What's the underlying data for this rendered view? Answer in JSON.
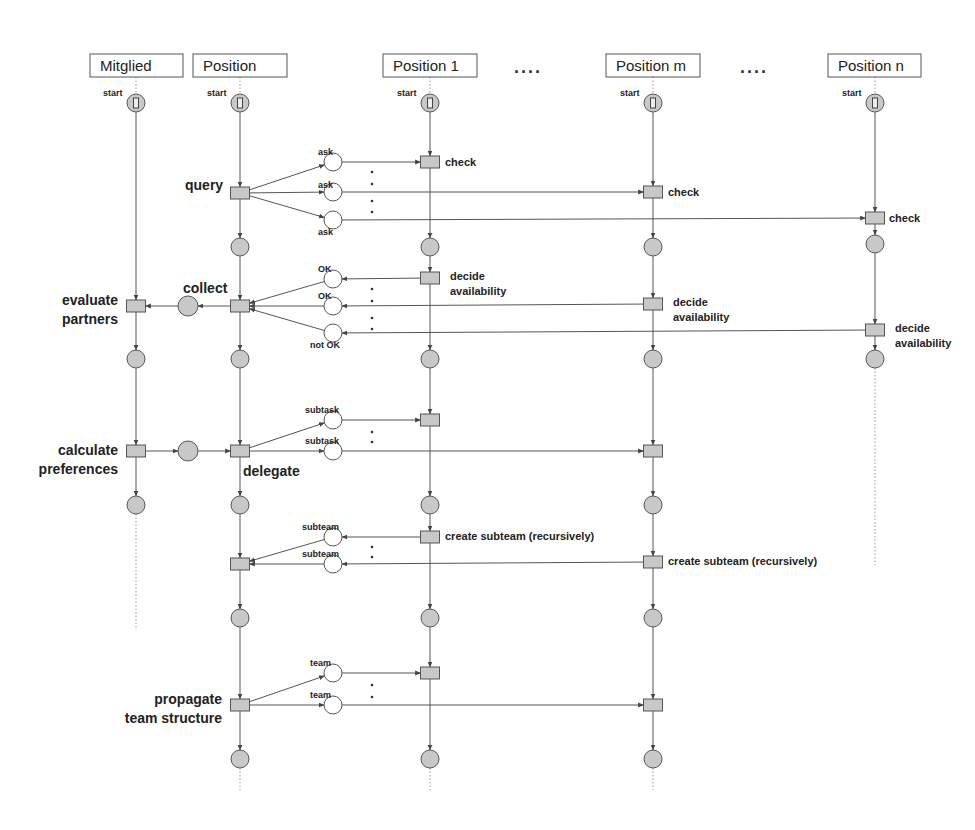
{
  "diagram": {
    "type": "petri-net-sequence",
    "lanes": [
      {
        "id": "mitglied",
        "title": "Mitglied",
        "x": 136,
        "box": [
          90,
          54,
          93,
          23
        ],
        "start_label": "start",
        "end_y": 630
      },
      {
        "id": "position",
        "title": "Position",
        "x": 240,
        "box": [
          193,
          54,
          94,
          23
        ],
        "start_label": "start",
        "end_y": 790
      },
      {
        "id": "position1",
        "title": "Position 1",
        "x": 430,
        "box": [
          383,
          54,
          94,
          23
        ],
        "start_label": "start",
        "end_y": 790
      },
      {
        "id": "positionm",
        "title": "Position m",
        "x": 653,
        "box": [
          606,
          54,
          94,
          23
        ],
        "start_label": "start",
        "end_y": 790
      },
      {
        "id": "positionn",
        "title": "Position n",
        "x": 875,
        "box": [
          828,
          54,
          93,
          23
        ],
        "start_label": "start",
        "end_y": 565
      }
    ],
    "header_ellipses": [
      {
        "text": "....",
        "x": 514,
        "y": 73
      },
      {
        "text": "....",
        "x": 740,
        "y": 73
      }
    ],
    "transitions": [
      {
        "id": "query",
        "x": 240,
        "y": 193,
        "label": "query",
        "label_style": "big",
        "lx": 185,
        "ly": 190
      },
      {
        "id": "check1",
        "x": 430,
        "y": 162,
        "label": "check",
        "label_style": "mid",
        "lx": 445,
        "ly": 166
      },
      {
        "id": "checkm",
        "x": 653,
        "y": 192,
        "label": "check",
        "label_style": "mid",
        "lx": 668,
        "ly": 196
      },
      {
        "id": "checkn",
        "x": 875,
        "y": 218,
        "label": "check",
        "label_style": "mid",
        "lx": 889,
        "ly": 222
      },
      {
        "id": "collect",
        "x": 240,
        "y": 306,
        "label": "collect",
        "label_style": "big",
        "lx": 183,
        "ly": 293
      },
      {
        "id": "evaluate",
        "x": 136,
        "y": 306,
        "label": "evaluate|partners",
        "label_style": "big",
        "lx": 118,
        "ly": 305,
        "anchor": "end"
      },
      {
        "id": "decide1",
        "x": 430,
        "y": 278,
        "label": "decide|availability",
        "label_style": "mid",
        "lx": 450,
        "ly": 280
      },
      {
        "id": "decidem",
        "x": 653,
        "y": 304,
        "label": "decide|availability",
        "label_style": "mid",
        "lx": 673,
        "ly": 306
      },
      {
        "id": "deciden",
        "x": 875,
        "y": 330,
        "label": "decide|availability",
        "label_style": "mid",
        "lx": 895,
        "ly": 332
      },
      {
        "id": "calculate",
        "x": 136,
        "y": 451,
        "label": "calculate|preferences",
        "label_style": "big",
        "lx": 118,
        "ly": 455,
        "anchor": "end"
      },
      {
        "id": "delegate",
        "x": 240,
        "y": 451,
        "label": "delegate",
        "label_style": "big",
        "lx": 243,
        "ly": 476
      },
      {
        "id": "sub1",
        "x": 430,
        "y": 420,
        "label": "",
        "label_style": "mid"
      },
      {
        "id": "subm",
        "x": 653,
        "y": 451,
        "label": "",
        "label_style": "mid"
      },
      {
        "id": "subteam_in",
        "x": 240,
        "y": 564,
        "label": "",
        "label_style": "mid"
      },
      {
        "id": "create1",
        "x": 430,
        "y": 537,
        "label": "create subteam (recursively)",
        "label_style": "mid",
        "lx": 445,
        "ly": 540
      },
      {
        "id": "createm",
        "x": 653,
        "y": 562,
        "label": "create subteam (recursively)",
        "label_style": "mid",
        "lx": 668,
        "ly": 565
      },
      {
        "id": "propagate",
        "x": 240,
        "y": 705,
        "label": "propagate|team structure",
        "label_style": "big",
        "lx": 222,
        "ly": 704,
        "anchor": "end"
      },
      {
        "id": "team1",
        "x": 430,
        "y": 673,
        "label": "",
        "label_style": "mid"
      },
      {
        "id": "teamm",
        "x": 653,
        "y": 705,
        "label": "",
        "label_style": "mid"
      }
    ],
    "lane_places": [
      {
        "x": 136,
        "y": 359
      },
      {
        "x": 136,
        "y": 505
      },
      {
        "x": 240,
        "y": 247
      },
      {
        "x": 240,
        "y": 359
      },
      {
        "x": 240,
        "y": 505
      },
      {
        "x": 240,
        "y": 618
      },
      {
        "x": 240,
        "y": 759
      },
      {
        "x": 430,
        "y": 247
      },
      {
        "x": 430,
        "y": 359
      },
      {
        "x": 430,
        "y": 505
      },
      {
        "x": 430,
        "y": 618
      },
      {
        "x": 430,
        "y": 759
      },
      {
        "x": 653,
        "y": 247
      },
      {
        "x": 653,
        "y": 359
      },
      {
        "x": 653,
        "y": 505
      },
      {
        "x": 653,
        "y": 618
      },
      {
        "x": 653,
        "y": 759
      },
      {
        "x": 875,
        "y": 244
      },
      {
        "x": 875,
        "y": 359
      }
    ],
    "inner_places": [
      {
        "x": 188,
        "y": 306
      },
      {
        "x": 188,
        "y": 451
      }
    ],
    "message_places": [
      {
        "x": 333,
        "y": 162,
        "label": "ask",
        "lx": 318,
        "ly": 155
      },
      {
        "x": 333,
        "y": 192,
        "label": "ask",
        "lx": 318,
        "ly": 188
      },
      {
        "x": 333,
        "y": 220,
        "label": "ask",
        "lx": 318,
        "ly": 235
      },
      {
        "x": 333,
        "y": 279,
        "label": "OK",
        "lx": 318,
        "ly": 272
      },
      {
        "x": 333,
        "y": 306,
        "label": "OK",
        "lx": 318,
        "ly": 299
      },
      {
        "x": 333,
        "y": 333,
        "label": "not OK",
        "lx": 310,
        "ly": 348
      },
      {
        "x": 333,
        "y": 420,
        "label": "subtask",
        "lx": 305,
        "ly": 413
      },
      {
        "x": 333,
        "y": 451,
        "label": "subtask",
        "lx": 305,
        "ly": 444
      },
      {
        "x": 333,
        "y": 537,
        "label": "subteam",
        "lx": 302,
        "ly": 530
      },
      {
        "x": 333,
        "y": 564,
        "label": "subteam",
        "lx": 302,
        "ly": 557
      },
      {
        "x": 333,
        "y": 673,
        "label": "team",
        "lx": 310,
        "ly": 666
      },
      {
        "x": 333,
        "y": 705,
        "label": "team",
        "lx": 310,
        "ly": 698
      }
    ],
    "vertical_dot_groups": [
      {
        "x": 372,
        "ys": [
          172,
          184,
          201,
          212
        ]
      },
      {
        "x": 372,
        "ys": [
          289,
          301,
          318,
          329
        ]
      },
      {
        "x": 372,
        "ys": [
          432,
          442
        ]
      },
      {
        "x": 372,
        "ys": [
          547,
          557
        ]
      },
      {
        "x": 372,
        "ys": [
          685,
          697
        ]
      }
    ],
    "arcs": [
      [
        240,
        193,
        333,
        162
      ],
      [
        240,
        193,
        333,
        192
      ],
      [
        240,
        193,
        333,
        220
      ],
      [
        333,
        162,
        430,
        162
      ],
      [
        333,
        192,
        653,
        192
      ],
      [
        333,
        220,
        875,
        218
      ],
      [
        430,
        278,
        333,
        279
      ],
      [
        653,
        304,
        333,
        306
      ],
      [
        875,
        330,
        333,
        333
      ],
      [
        333,
        279,
        240,
        306
      ],
      [
        333,
        306,
        240,
        306
      ],
      [
        333,
        333,
        240,
        306
      ],
      [
        240,
        306,
        188,
        306
      ],
      [
        188,
        306,
        136,
        306
      ],
      [
        136,
        451,
        188,
        451
      ],
      [
        188,
        451,
        240,
        451
      ],
      [
        240,
        451,
        333,
        420
      ],
      [
        240,
        451,
        333,
        451
      ],
      [
        333,
        420,
        430,
        420
      ],
      [
        333,
        451,
        653,
        451
      ],
      [
        430,
        537,
        333,
        537
      ],
      [
        653,
        562,
        333,
        564
      ],
      [
        333,
        537,
        240,
        564
      ],
      [
        333,
        564,
        240,
        564
      ],
      [
        240,
        705,
        333,
        673
      ],
      [
        240,
        705,
        333,
        705
      ],
      [
        333,
        673,
        430,
        673
      ],
      [
        333,
        705,
        653,
        705
      ]
    ]
  }
}
